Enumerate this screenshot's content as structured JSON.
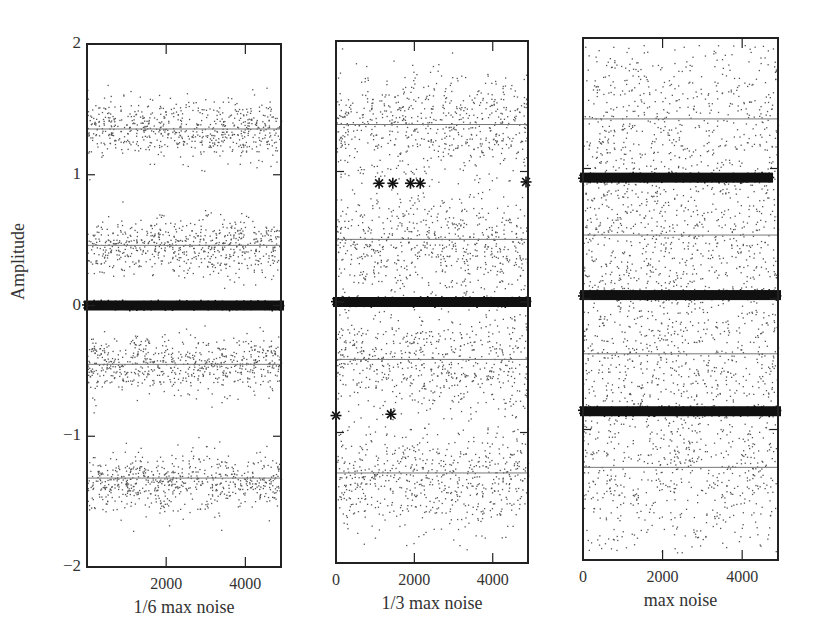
{
  "chart_data": {
    "type": "scatter",
    "title": "",
    "ylabel": "Amplitude",
    "ylim": [
      -2,
      2
    ],
    "yticks": [
      2,
      1,
      0,
      -1,
      -2
    ],
    "xticks": [
      0,
      2000,
      4000
    ],
    "xlim": [
      0,
      4900
    ],
    "grid": false,
    "legend": null,
    "panels": [
      {
        "xlabel": "1/6 max noise",
        "xtick_labels": [
          "2000",
          "4000"
        ],
        "noise_spread": 0.11,
        "band_centers": [
          1.35,
          0.45,
          -0.45,
          -1.35
        ],
        "fitted_lines": [
          1.35,
          0.46,
          -0.45,
          -1.32
        ],
        "star_bands": [
          {
            "y": 0.0,
            "x_from": 0,
            "x_to": 4900,
            "dense": true
          }
        ],
        "isolated_stars": []
      },
      {
        "xlabel": "1/3 max noise",
        "xtick_labels": [
          "0",
          "2000",
          "4000"
        ],
        "noise_spread": 0.2,
        "band_centers": [
          1.35,
          0.45,
          -0.45,
          -1.35
        ],
        "fitted_lines": [
          1.36,
          0.48,
          -0.44,
          -1.31
        ],
        "star_bands": [
          {
            "y": 0.0,
            "x_from": 0,
            "x_to": 4900,
            "dense": true
          }
        ],
        "isolated_stars": [
          {
            "x": 1100,
            "y": 0.91
          },
          {
            "x": 1450,
            "y": 0.91
          },
          {
            "x": 1900,
            "y": 0.91
          },
          {
            "x": 2150,
            "y": 0.91
          },
          {
            "x": 4850,
            "y": 0.92
          },
          {
            "x": 0,
            "y": -0.87
          },
          {
            "x": 1400,
            "y": -0.86
          }
        ]
      },
      {
        "xlabel": "max noise",
        "xtick_labels": [
          "0",
          "2000",
          "4000"
        ],
        "noise_spread": 0.42,
        "band_centers": [
          1.35,
          0.45,
          -0.45,
          -1.35
        ],
        "fitted_lines": [
          1.38,
          0.49,
          -0.42,
          -1.29
        ],
        "star_bands": [
          {
            "y": 0.93,
            "x_from": 0,
            "x_to": 4700,
            "dense": true
          },
          {
            "y": 0.03,
            "x_from": 0,
            "x_to": 4900,
            "dense": true
          },
          {
            "y": -0.86,
            "x_from": 0,
            "x_to": 4900,
            "dense": true
          }
        ],
        "isolated_stars": []
      }
    ]
  },
  "colors": {
    "axis": "#222222",
    "points": "#555555",
    "fit_line": "#777777",
    "stars": "#111111",
    "background": "#ffffff"
  },
  "layout": {
    "panels_px": [
      {
        "x0": 87,
        "x1": 281,
        "y_top": 44,
        "y_bot": 567
      },
      {
        "x0": 336,
        "x1": 528,
        "y_top": 41,
        "y_bot": 563
      },
      {
        "x0": 583,
        "x1": 778,
        "y_top": 38,
        "y_bot": 560
      }
    ]
  }
}
